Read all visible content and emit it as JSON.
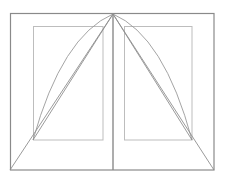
{
  "canvas": {
    "width": 226,
    "height": 182,
    "background": "#ffffff",
    "title": "Gothic arch construction line drawing"
  },
  "style": {
    "outer_frame_color": "#8a8a8a",
    "inner_panel_color": "#bdbdbd",
    "center_line_color": "#8a8a8a",
    "arc_color": "#9a9a9a",
    "chord_color": "#8f8f8f",
    "outer_frame_width": 1.2,
    "inner_panel_width": 1.0,
    "center_line_width": 1.4,
    "arc_width": 0.9,
    "chord_width": 0.9
  },
  "chart_data": {
    "type": "line",
    "xlabel": "",
    "ylabel": "",
    "xlim": [
      0,
      226
    ],
    "ylim": [
      0,
      182
    ],
    "grid": false,
    "legend": "none",
    "points": {
      "apex": [
        113,
        14
      ],
      "outer_top_left": [
        10,
        13
      ],
      "outer_top_right": [
        214,
        13
      ],
      "outer_bottom_left": [
        10,
        170
      ],
      "outer_bottom_right": [
        214,
        170
      ],
      "left_panel_top_left": [
        33,
        26
      ],
      "left_panel_top_right": [
        103,
        26
      ],
      "left_panel_bottom_left": [
        33,
        140
      ],
      "left_panel_bottom_right": [
        103,
        140
      ],
      "right_panel_top_left": [
        124,
        26
      ],
      "right_panel_top_right": [
        192,
        26
      ],
      "right_panel_bottom_left": [
        124,
        140
      ],
      "right_panel_bottom_right": [
        192,
        140
      ],
      "center_top": [
        113,
        14
      ],
      "center_bottom": [
        113,
        170
      ]
    },
    "series": [
      {
        "name": "outer-frame",
        "kind": "rect",
        "x": 10,
        "y": 13,
        "w": 204,
        "h": 157
      },
      {
        "name": "left-inner-panel",
        "kind": "rect",
        "x": 33,
        "y": 26,
        "w": 70,
        "h": 114
      },
      {
        "name": "right-inner-panel",
        "kind": "rect",
        "x": 124,
        "y": 26,
        "w": 68,
        "h": 114
      },
      {
        "name": "center-vertical",
        "kind": "line",
        "x": [
          113,
          113
        ],
        "y": [
          14,
          170
        ]
      },
      {
        "name": "left-arc",
        "kind": "quadratic-arc",
        "start": [
          33,
          140
        ],
        "control": [
          62,
          36
        ],
        "end": [
          113,
          14
        ]
      },
      {
        "name": "right-arc",
        "kind": "quadratic-arc",
        "start": [
          192,
          140
        ],
        "control": [
          164,
          36
        ],
        "end": [
          113,
          14
        ]
      },
      {
        "name": "left-inner-chord",
        "kind": "line",
        "x": [
          33,
          113
        ],
        "y": [
          140,
          14
        ]
      },
      {
        "name": "right-inner-chord",
        "kind": "line",
        "x": [
          192,
          113
        ],
        "y": [
          140,
          14
        ]
      },
      {
        "name": "left-outer-chord",
        "kind": "line",
        "x": [
          10,
          113
        ],
        "y": [
          170,
          14
        ]
      },
      {
        "name": "right-outer-chord",
        "kind": "line",
        "x": [
          214,
          113
        ],
        "y": [
          170,
          14
        ]
      }
    ]
  }
}
